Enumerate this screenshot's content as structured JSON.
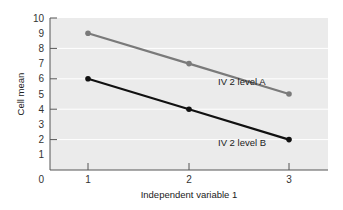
{
  "chart_data": {
    "type": "line",
    "title": "",
    "xlabel": "Independent variable 1",
    "ylabel": "Cell mean",
    "categories": [
      "1",
      "2",
      "3"
    ],
    "x": [
      1,
      2,
      3
    ],
    "ylim": [
      0,
      10
    ],
    "yticks": [
      "0",
      "1",
      "2",
      "3",
      "4",
      "5",
      "6",
      "7",
      "8",
      "9",
      "10"
    ],
    "grid": true,
    "legend": "inline labels",
    "series": [
      {
        "name": "IV 2 level A",
        "values": [
          9,
          7,
          5
        ],
        "color": "#7a7a7a"
      },
      {
        "name": "IV 2 level B",
        "values": [
          6,
          4,
          2
        ],
        "color": "#111111"
      }
    ]
  },
  "colors": {
    "plot_bg": "#ebebeb",
    "grid": "#ffffff",
    "axis": "#555555"
  }
}
